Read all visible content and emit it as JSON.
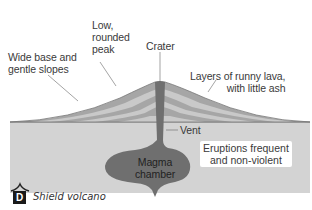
{
  "figure": {
    "badge": "D",
    "caption": "Shield volcano"
  },
  "labels": {
    "wide_base": [
      "Wide base and",
      "gentle slopes"
    ],
    "low_peak": [
      "Low,",
      "rounded",
      "peak"
    ],
    "crater": "Crater",
    "layers": [
      "Layers of runny lava,",
      "with little ash"
    ],
    "vent": "Vent",
    "eruptions": [
      "Eruptions frequent",
      "and non-violent"
    ],
    "magma_chamber": [
      "Magma",
      "chamber"
    ]
  },
  "colors": {
    "ground": "#d3d3d3",
    "layer_dark": "#a6a6a6",
    "layer_light": "#c9c9c9",
    "outline": "#777777",
    "vent": "#6f6f6f",
    "badge": "#1a1a1a"
  }
}
